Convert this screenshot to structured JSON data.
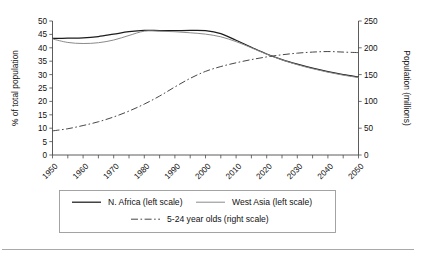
{
  "chart_data": {
    "type": "line",
    "title": "",
    "xlabel": "",
    "ylabel": "% of total population",
    "y2label": "Population (millions)",
    "grid": false,
    "legend_position": "bottom",
    "xlim": [
      1950,
      2050
    ],
    "ylim": [
      0,
      50
    ],
    "y2lim": [
      0,
      250
    ],
    "x_tick_labels": [
      "1950",
      "1960",
      "1970",
      "1980",
      "1990",
      "2000",
      "2010",
      "2020",
      "2030",
      "2040",
      "2050"
    ],
    "x_tick_values": [
      1950,
      1960,
      1970,
      1980,
      1990,
      2000,
      2010,
      2020,
      2030,
      2040,
      2050
    ],
    "x_minor_tick_interval": 5,
    "y_tick_labels": [
      "0",
      "5",
      "10",
      "15",
      "20",
      "25",
      "30",
      "35",
      "40",
      "45",
      "50"
    ],
    "y_tick_values": [
      0,
      5,
      10,
      15,
      20,
      25,
      30,
      35,
      40,
      45,
      50
    ],
    "y2_tick_labels": [
      "0",
      "50",
      "100",
      "150",
      "200",
      "250"
    ],
    "y2_tick_values": [
      0,
      50,
      100,
      150,
      200,
      250
    ],
    "x": [
      1950,
      1955,
      1960,
      1965,
      1970,
      1975,
      1980,
      1985,
      1990,
      1995,
      2000,
      2005,
      2010,
      2015,
      2020,
      2025,
      2030,
      2035,
      2040,
      2045,
      2050
    ],
    "series": [
      {
        "name": "N. Africa (left scale)",
        "axis": "left",
        "style": "solid",
        "units": "% of total population",
        "values": [
          43.5,
          43.6,
          43.7,
          44.2,
          45.1,
          46.0,
          46.5,
          46.4,
          46.4,
          46.5,
          46.4,
          45.3,
          42.8,
          40.2,
          37.7,
          35.6,
          33.9,
          32.4,
          31.1,
          30.0,
          29.1
        ]
      },
      {
        "name": "West Asia (left scale)",
        "axis": "left",
        "style": "light-solid",
        "units": "% of total population",
        "values": [
          43.3,
          42.0,
          41.6,
          41.9,
          42.9,
          44.6,
          46.2,
          46.2,
          46.0,
          45.6,
          45.1,
          44.1,
          42.3,
          40.0,
          37.6,
          35.5,
          33.7,
          32.2,
          30.9,
          29.8,
          28.9
        ]
      },
      {
        "name": "5-24 year olds (right scale)",
        "axis": "right",
        "style": "dash-dot",
        "units": "millions",
        "values": [
          45,
          49,
          55,
          62,
          71,
          82,
          95,
          110,
          127,
          143,
          156,
          165,
          172,
          178,
          183,
          187,
          190,
          192,
          193,
          192,
          191
        ]
      }
    ]
  },
  "legend": {
    "items": [
      {
        "label": "N. Africa (left scale)",
        "style": "solid"
      },
      {
        "label": "West Asia (left scale)",
        "style": "light-solid"
      },
      {
        "label": "5-24 year olds (right scale)",
        "style": "dash-dot"
      }
    ]
  }
}
